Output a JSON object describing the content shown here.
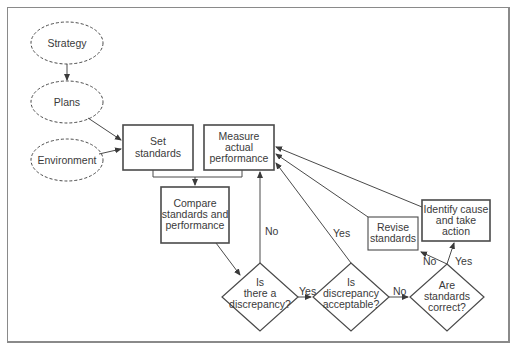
{
  "diagram": {
    "type": "flowchart",
    "nodes": {
      "strategy": {
        "label": "Strategy",
        "shape": "dashed-ellipse"
      },
      "plans": {
        "label": "Plans",
        "shape": "dashed-ellipse"
      },
      "environment": {
        "label": "Environment",
        "shape": "dashed-ellipse"
      },
      "set_standards": {
        "label_line1": "Set",
        "label_line2": "standards",
        "shape": "box"
      },
      "measure": {
        "label_line1": "Measure",
        "label_line2": "actual",
        "label_line3": "performance",
        "shape": "box"
      },
      "compare": {
        "label_line1": "Compare",
        "label_line2": "standards and",
        "label_line3": "performance",
        "shape": "box"
      },
      "discrepancy": {
        "label_line1": "Is",
        "label_line2": "there a",
        "label_line3": "discrepancy?",
        "shape": "diamond"
      },
      "acceptable": {
        "label_line1": "Is",
        "label_line2": "discrepancy",
        "label_line3": "acceptable?",
        "shape": "diamond"
      },
      "correct": {
        "label_line1": "Are",
        "label_line2": "standards",
        "label_line3": "correct?",
        "shape": "diamond"
      },
      "revise": {
        "label_line1": "Revise",
        "label_line2": "standards",
        "shape": "box-thin"
      },
      "identify": {
        "label_line1": "Identify cause",
        "label_line2": "and take",
        "label_line3": "action",
        "shape": "box"
      }
    },
    "edge_labels": {
      "discrepancy_no": "No",
      "discrepancy_yes": "Yes",
      "acceptable_yes": "Yes",
      "acceptable_no": "No",
      "correct_no": "No",
      "correct_yes": "Yes"
    },
    "edges": [
      {
        "from": "strategy",
        "to": "plans"
      },
      {
        "from": "plans",
        "to": "set_standards"
      },
      {
        "from": "environment",
        "to": "set_standards"
      },
      {
        "from": "set_standards+measure",
        "to": "compare"
      },
      {
        "from": "compare",
        "to": "discrepancy"
      },
      {
        "from": "discrepancy",
        "to": "measure",
        "label": "No"
      },
      {
        "from": "discrepancy",
        "to": "acceptable",
        "label": "Yes"
      },
      {
        "from": "acceptable",
        "to": "measure",
        "label": "Yes"
      },
      {
        "from": "acceptable",
        "to": "correct",
        "label": "No"
      },
      {
        "from": "correct",
        "to": "revise",
        "label": "No"
      },
      {
        "from": "correct",
        "to": "identify",
        "label": "Yes"
      },
      {
        "from": "revise",
        "to": "measure"
      },
      {
        "from": "identify",
        "to": "measure"
      }
    ]
  },
  "colors": {
    "line": "#4a4a4a",
    "frame": "#8a8a8a",
    "background": "#ffffff"
  }
}
